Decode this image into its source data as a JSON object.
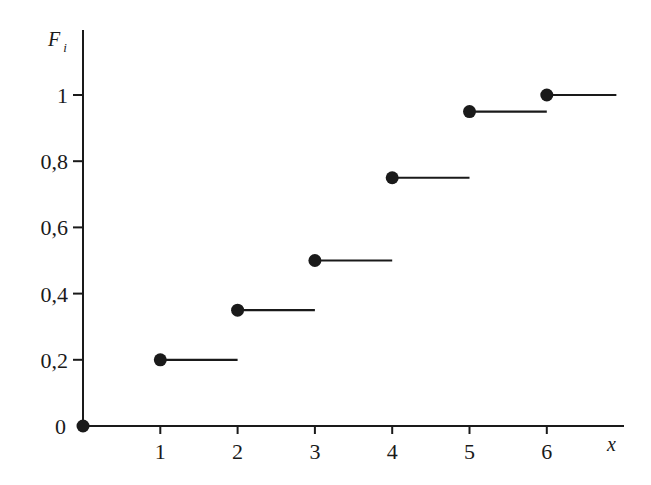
{
  "chart_data": {
    "type": "line",
    "subtype": "step",
    "title": "",
    "xlabel": "x",
    "ylabel": "F_i",
    "ylabel_main": "F",
    "ylabel_sub": "i",
    "x_ticks": [
      1,
      2,
      3,
      4,
      5,
      6
    ],
    "x_tick_labels": [
      "1",
      "2",
      "3",
      "4",
      "5",
      "6"
    ],
    "y_ticks": [
      0,
      0.2,
      0.4,
      0.6,
      0.8,
      1
    ],
    "y_tick_labels": [
      "0",
      "0,2",
      "0,4",
      "0,6",
      "0,8",
      "1"
    ],
    "xlim": [
      0,
      6.9
    ],
    "ylim": [
      0,
      1.2
    ],
    "grid": false,
    "legend": null,
    "series": [
      {
        "name": "F_i",
        "points": [
          {
            "x": 0,
            "y": 0,
            "x_end": 1
          },
          {
            "x": 1,
            "y": 0.2,
            "x_end": 2
          },
          {
            "x": 2,
            "y": 0.35,
            "x_end": 3
          },
          {
            "x": 3,
            "y": 0.5,
            "x_end": 4
          },
          {
            "x": 4,
            "y": 0.75,
            "x_end": 5
          },
          {
            "x": 5,
            "y": 0.95,
            "x_end": 6
          },
          {
            "x": 6,
            "y": 1.0,
            "x_end": 6.9
          }
        ],
        "marker": "filled-circle",
        "color": "#1a1a1a"
      }
    ]
  },
  "colors": {
    "ink": "#1a1a1a",
    "background": "#ffffff"
  }
}
